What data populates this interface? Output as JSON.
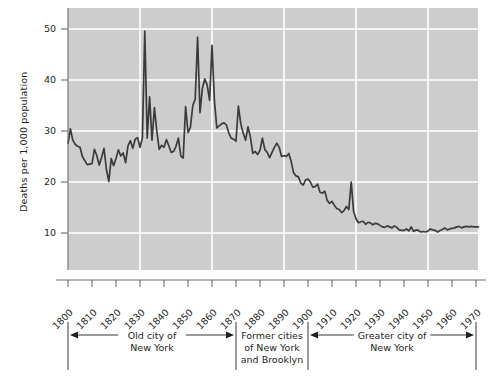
{
  "chart_data": {
    "type": "line",
    "title": "",
    "subtitle": "",
    "xlabel": "",
    "ylabel": "Deaths per 1,000 population",
    "xlim": [
      1800,
      1971
    ],
    "ylim": [
      5,
      52
    ],
    "grid": true,
    "legend_position": "none",
    "y_ticks": [
      10,
      20,
      30,
      40,
      50
    ],
    "x_ticks": [
      1800,
      1810,
      1820,
      1830,
      1840,
      1850,
      1860,
      1870,
      1880,
      1890,
      1900,
      1910,
      1920,
      1930,
      1940,
      1950,
      1960,
      1970
    ],
    "x_gridlines": [
      1830,
      1860,
      1890,
      1920,
      1950
    ],
    "y_gridlines": [
      10,
      20,
      30,
      40,
      50
    ],
    "series": [
      {
        "name": "Crude death rate, New York City",
        "color": "#3b3b3b",
        "x": [
          1800,
          1801,
          1802,
          1803,
          1804,
          1805,
          1806,
          1807,
          1808,
          1809,
          1810,
          1811,
          1812,
          1813,
          1814,
          1815,
          1816,
          1817,
          1818,
          1819,
          1820,
          1821,
          1822,
          1823,
          1824,
          1825,
          1826,
          1827,
          1828,
          1829,
          1830,
          1831,
          1832,
          1833,
          1834,
          1835,
          1836,
          1837,
          1838,
          1839,
          1840,
          1841,
          1842,
          1843,
          1844,
          1845,
          1846,
          1847,
          1848,
          1849,
          1850,
          1851,
          1852,
          1853,
          1854,
          1855,
          1856,
          1857,
          1858,
          1859,
          1860,
          1861,
          1862,
          1863,
          1864,
          1865,
          1866,
          1867,
          1868,
          1869,
          1870,
          1871,
          1872,
          1873,
          1874,
          1875,
          1876,
          1877,
          1878,
          1879,
          1880,
          1881,
          1882,
          1883,
          1884,
          1885,
          1886,
          1887,
          1888,
          1889,
          1890,
          1891,
          1892,
          1893,
          1894,
          1895,
          1896,
          1897,
          1898,
          1899,
          1900,
          1901,
          1902,
          1903,
          1904,
          1905,
          1906,
          1907,
          1908,
          1909,
          1910,
          1911,
          1912,
          1913,
          1914,
          1915,
          1916,
          1917,
          1918,
          1919,
          1920,
          1921,
          1922,
          1923,
          1924,
          1925,
          1926,
          1927,
          1928,
          1929,
          1930,
          1931,
          1932,
          1933,
          1934,
          1935,
          1936,
          1937,
          1938,
          1939,
          1940,
          1941,
          1942,
          1943,
          1944,
          1945,
          1946,
          1947,
          1948,
          1949,
          1950,
          1951,
          1952,
          1953,
          1954,
          1955,
          1956,
          1957,
          1958,
          1959,
          1960,
          1961,
          1962,
          1963,
          1964,
          1965,
          1966,
          1967,
          1968,
          1969,
          1970,
          1971
        ],
        "y": [
          27.6,
          30.4,
          28.2,
          27.4,
          27.0,
          26.8,
          25.0,
          24.2,
          23.4,
          23.5,
          23.6,
          26.4,
          25.2,
          23.3,
          24.8,
          26.6,
          22.5,
          20.1,
          24.6,
          23.2,
          24.6,
          26.3,
          25.1,
          25.7,
          23.8,
          27.1,
          28.1,
          26.6,
          28.4,
          28.7,
          26.8,
          28.6,
          49.6,
          28.6,
          36.7,
          28.2,
          34.6,
          30.0,
          26.4,
          27.2,
          26.8,
          28.3,
          27.1,
          25.8,
          26.0,
          27.0,
          28.6,
          25.1,
          24.7,
          34.8,
          29.7,
          30.7,
          35.0,
          36.2,
          48.4,
          33.6,
          38.4,
          40.2,
          39.0,
          36.0,
          46.8,
          36.0,
          30.6,
          31.0,
          31.4,
          31.6,
          31.2,
          29.6,
          28.6,
          28.4,
          28.0,
          34.9,
          31.4,
          29.6,
          28.2,
          30.8,
          28.8,
          25.6,
          26.0,
          25.4,
          26.2,
          28.6,
          26.4,
          25.8,
          24.8,
          25.8,
          26.8,
          27.6,
          26.8,
          25.0,
          25.2,
          25.0,
          25.6,
          24.0,
          21.8,
          21.2,
          21.0,
          19.8,
          19.4,
          20.4,
          20.6,
          20.0,
          19.0,
          19.1,
          19.6,
          18.0,
          17.8,
          18.2,
          16.4,
          15.8,
          16.2,
          15.4,
          14.8,
          14.6,
          14.0,
          14.4,
          15.2,
          14.6,
          20.0,
          14.2,
          12.8,
          12.0,
          12.2,
          12.3,
          11.7,
          12.1,
          12.0,
          11.6,
          11.9,
          11.8,
          11.5,
          11.2,
          11.1,
          11.4,
          11.2,
          11.0,
          11.4,
          11.1,
          10.6,
          10.5,
          10.5,
          10.8,
          10.4,
          11.2,
          10.3,
          10.6,
          10.5,
          10.2,
          10.3,
          10.2,
          10.4,
          10.8,
          10.6,
          10.5,
          10.2,
          10.5,
          10.7,
          11.0,
          10.6,
          10.8,
          10.9,
          11.0,
          11.2,
          11.3,
          11.0,
          11.2,
          11.3,
          11.2,
          11.3,
          11.2,
          11.2,
          11.2
        ]
      }
    ],
    "annotations": {
      "brackets": [
        {
          "id": "old-city",
          "lines": [
            "Old city of",
            "New York"
          ],
          "from_year": 1800,
          "to_year": 1870,
          "style": "double-arrow"
        },
        {
          "id": "former-cities",
          "lines": [
            "Former cities",
            "of New York",
            "and Brooklyn"
          ],
          "from_year": 1870,
          "to_year": 1900,
          "style": "plain"
        },
        {
          "id": "greater-city",
          "lines": [
            "Greater city of",
            "New York"
          ],
          "from_year": 1900,
          "to_year": 1970,
          "style": "double-arrow"
        }
      ],
      "divider_years": [
        1800,
        1870,
        1900,
        1970
      ]
    },
    "colors": {
      "plot_background": "#cdcdcd",
      "gridline": "#ffffff",
      "line": "#3b3b3b",
      "axis": "#6d6d6d",
      "text": "#231f20",
      "page_background": "#ffffff"
    }
  }
}
